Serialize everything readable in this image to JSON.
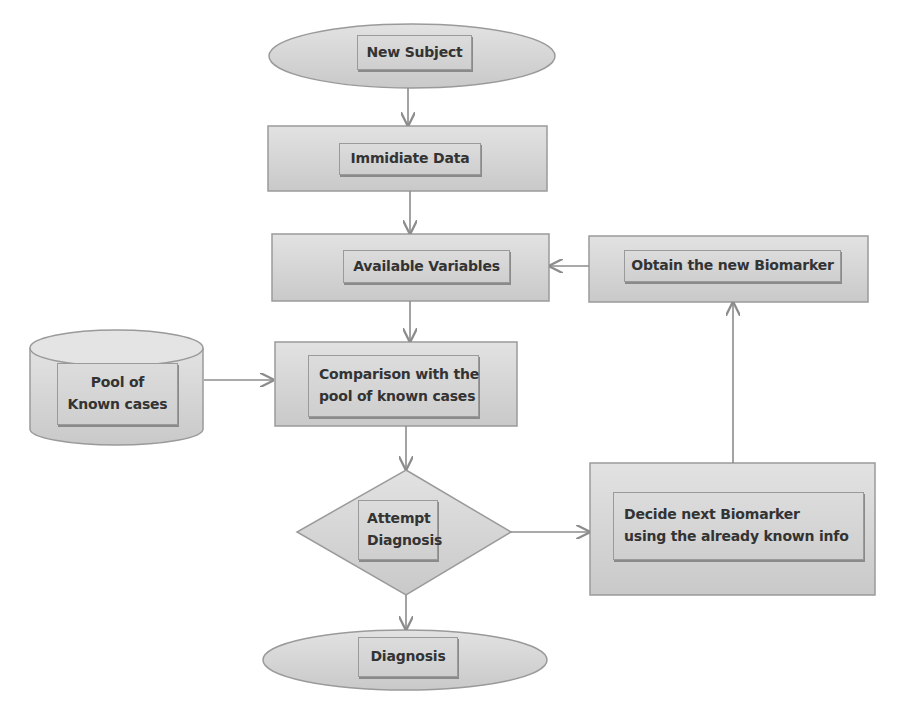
{
  "diagram": {
    "type": "flowchart",
    "nodes": {
      "new_subject": {
        "shape": "ellipse",
        "label": "New Subject"
      },
      "immidiate_data": {
        "shape": "process",
        "label": "Immidiate Data"
      },
      "available_variables": {
        "shape": "process",
        "label": "Available Variables"
      },
      "obtain_biomarker": {
        "shape": "process",
        "label": "Obtain the new Biomarker"
      },
      "pool": {
        "shape": "database",
        "line1": "Pool of",
        "line2": "Known cases"
      },
      "comparison": {
        "shape": "process",
        "line1": "Comparison with the",
        "line2": "pool of known cases"
      },
      "attempt": {
        "shape": "decision",
        "line1": "Attempt",
        "line2": "Diagnosis"
      },
      "decide": {
        "shape": "process",
        "line1": "Decide next Biomarker",
        "line2": "using the already known info"
      },
      "diagnosis": {
        "shape": "ellipse",
        "label": "Diagnosis"
      }
    },
    "edges": [
      {
        "from": "New Subject",
        "to": "Immidiate Data"
      },
      {
        "from": "Immidiate Data",
        "to": "Available Variables"
      },
      {
        "from": "Available Variables",
        "to": "Comparison with the pool of known cases"
      },
      {
        "from": "Pool of Known cases",
        "to": "Comparison with the pool of known cases"
      },
      {
        "from": "Comparison with the pool of known cases",
        "to": "Attempt Diagnosis"
      },
      {
        "from": "Attempt Diagnosis",
        "to": "Diagnosis"
      },
      {
        "from": "Attempt Diagnosis",
        "to": "Decide next Biomarker using the already known info"
      },
      {
        "from": "Decide next Biomarker using the already known info",
        "to": "Obtain the new Biomarker"
      },
      {
        "from": "Obtain the new Biomarker",
        "to": "Available Variables"
      }
    ],
    "colors": {
      "fill": "#d6d6d6",
      "stroke": "#9a9a9a",
      "arrow": "#8c8c8c",
      "text": "#333333"
    }
  }
}
